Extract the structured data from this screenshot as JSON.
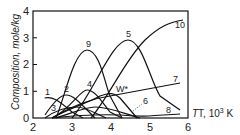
{
  "chart_data": {
    "type": "line",
    "title": "",
    "xlabel": "T, 10³ K",
    "ylabel": "Composition, mole/kg",
    "xlim": [
      2,
      6
    ],
    "ylim": [
      0,
      4
    ],
    "xticks": [
      "2",
      "3",
      "4",
      "5",
      "6"
    ],
    "yticks": [
      "0",
      "1",
      "2",
      "3",
      "4"
    ],
    "grid": false,
    "legend": "inline curve labels",
    "series": [
      {
        "name": "1",
        "x": [
          2.3,
          2.6,
          3.0,
          3.4
        ],
        "values": [
          0.75,
          0.6,
          0.2,
          0.0
        ]
      },
      {
        "name": "2",
        "x": [
          2.3,
          2.8,
          3.2,
          3.8
        ],
        "values": [
          0.1,
          0.85,
          0.6,
          0.0
        ]
      },
      {
        "name": "3",
        "x": [
          2.3,
          2.8,
          3.4,
          4.0
        ],
        "values": [
          0.0,
          0.35,
          0.4,
          0.0
        ]
      },
      {
        "name": "4",
        "x": [
          2.5,
          3.4,
          4.0,
          4.6
        ],
        "values": [
          0.0,
          1.05,
          0.4,
          0.0
        ]
      },
      {
        "name": "5",
        "x": [
          3.0,
          3.8,
          4.5,
          5.2,
          5.8
        ],
        "values": [
          0.0,
          2.0,
          2.9,
          1.6,
          0.3
        ]
      },
      {
        "name": "6",
        "x": [
          2.6,
          3.6,
          4.4,
          5.0
        ],
        "values": [
          0.0,
          0.4,
          0.3,
          0.0
        ]
      },
      {
        "name": "7",
        "x": [
          2.5,
          4.0,
          5.8
        ],
        "values": [
          0.0,
          0.8,
          1.3
        ]
      },
      {
        "name": "8",
        "x": [
          2.5,
          4.0,
          5.0,
          5.8
        ],
        "values": [
          0.0,
          0.15,
          0.05,
          0.15
        ]
      },
      {
        "name": "9",
        "x": [
          2.6,
          3.1,
          3.5,
          4.0,
          4.6
        ],
        "values": [
          0.0,
          1.8,
          2.55,
          1.4,
          0.0
        ]
      },
      {
        "name": "10",
        "x": [
          3.5,
          4.5,
          5.0,
          5.5,
          5.9
        ],
        "values": [
          0.0,
          1.5,
          2.8,
          3.5,
          3.7
        ]
      },
      {
        "name": "W*",
        "x": [
          2.5,
          3.5,
          4.3,
          5.0
        ],
        "values": [
          0.0,
          0.5,
          0.95,
          0.2
        ]
      }
    ]
  },
  "labels": {
    "ylabel": "Composition, mole/kg",
    "xlabel": "T, 10",
    "xlabel_sup": "3",
    "xlabel_unit": " K",
    "curve_1": "1",
    "curve_2": "2",
    "curve_3": "3",
    "curve_4": "4",
    "curve_5": "5",
    "curve_6": "6",
    "curve_7": "7",
    "curve_8": "8",
    "curve_9": "9",
    "curve_10": "10",
    "curve_w": "W*",
    "xt0": "2",
    "xt1": "3",
    "xt2": "4",
    "xt3": "5",
    "xt4": "6",
    "yt0": "0",
    "yt1": "1",
    "yt2": "2",
    "yt3": "3",
    "yt4": "4"
  }
}
